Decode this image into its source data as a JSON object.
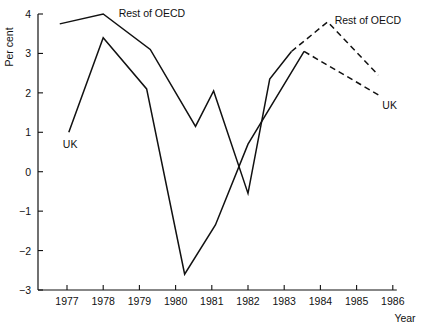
{
  "chart_data": {
    "type": "line",
    "title": "",
    "xlabel": "Year",
    "ylabel": "Per cent",
    "xlim": [
      1976.2,
      1986.0
    ],
    "ylim": [
      -3,
      4
    ],
    "grid": false,
    "legend_position": "inline-annotations",
    "xticks": [
      "1977",
      "1978",
      "1979",
      "1980",
      "1981",
      "1982",
      "1983",
      "1984",
      "1985",
      "1986"
    ],
    "yticks": [
      "4",
      "3",
      "2",
      "1",
      "0",
      "-1",
      "-2",
      "-3"
    ],
    "series": [
      {
        "name": "Rest of OECD",
        "style": "solid-then-dashed",
        "actual": [
          {
            "x": 1976.8,
            "y": 3.75
          },
          {
            "x": 1978.0,
            "y": 4.0
          },
          {
            "x": 1979.3,
            "y": 3.1
          },
          {
            "x": 1980.55,
            "y": 1.15
          },
          {
            "x": 1981.05,
            "y": 2.05
          },
          {
            "x": 1982.0,
            "y": -0.55
          },
          {
            "x": 1982.6,
            "y": 2.35
          },
          {
            "x": 1983.2,
            "y": 3.05
          }
        ],
        "forecast": [
          {
            "x": 1983.2,
            "y": 3.05
          },
          {
            "x": 1984.2,
            "y": 3.8
          },
          {
            "x": 1985.6,
            "y": 2.45
          }
        ]
      },
      {
        "name": "UK",
        "style": "solid-then-dashed",
        "actual": [
          {
            "x": 1977.05,
            "y": 1.0
          },
          {
            "x": 1978.0,
            "y": 3.4
          },
          {
            "x": 1979.2,
            "y": 2.1
          },
          {
            "x": 1980.25,
            "y": -2.6
          },
          {
            "x": 1981.1,
            "y": -1.35
          },
          {
            "x": 1982.0,
            "y": 0.7
          },
          {
            "x": 1983.55,
            "y": 3.05
          }
        ],
        "forecast": [
          {
            "x": 1983.55,
            "y": 3.05
          },
          {
            "x": 1985.6,
            "y": 1.95
          }
        ]
      }
    ],
    "annotations": [
      {
        "text": "Rest of OECD",
        "x": 1978.15,
        "y": 4.0,
        "anchor": "start",
        "dx": 10,
        "dy": 3
      },
      {
        "text": "UK",
        "x": 1977.05,
        "y": 1.0,
        "anchor": "start",
        "dx": -6,
        "dy": 16
      },
      {
        "text": "Rest of OECD",
        "x": 1984.2,
        "y": 3.8,
        "anchor": "start",
        "dx": 7,
        "dy": 2
      },
      {
        "text": "UK",
        "x": 1985.6,
        "y": 1.95,
        "anchor": "start",
        "dx": 4,
        "dy": 14
      }
    ]
  }
}
